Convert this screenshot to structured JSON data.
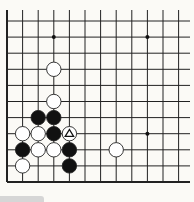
{
  "board": {
    "columns": 12,
    "rows": 11,
    "origin_x": 7,
    "origin_y": 21,
    "step_x": 15.6,
    "step_y": 16.1,
    "top_edge_y": 10,
    "right_edge_x": 190,
    "line_color": "#222222",
    "background": "#fbfaf6",
    "star_points": [
      {
        "col": 3,
        "row": 1
      },
      {
        "col": 9,
        "row": 1
      },
      {
        "col": 9,
        "row": 7
      }
    ],
    "stones": [
      {
        "color": "white",
        "col": 3,
        "row": 3
      },
      {
        "color": "white",
        "col": 3,
        "row": 5
      },
      {
        "color": "black",
        "col": 2,
        "row": 6
      },
      {
        "color": "black",
        "col": 3,
        "row": 6
      },
      {
        "color": "white",
        "col": 1,
        "row": 7
      },
      {
        "color": "white",
        "col": 2,
        "row": 7
      },
      {
        "color": "black",
        "col": 3,
        "row": 7
      },
      {
        "color": "white",
        "col": 4,
        "row": 7,
        "marker": "triangle"
      },
      {
        "color": "black",
        "col": 1,
        "row": 8
      },
      {
        "color": "white",
        "col": 2,
        "row": 8
      },
      {
        "color": "white",
        "col": 3,
        "row": 8
      },
      {
        "color": "black",
        "col": 4,
        "row": 8
      },
      {
        "color": "white",
        "col": 7,
        "row": 8
      },
      {
        "color": "white",
        "col": 1,
        "row": 9
      },
      {
        "color": "black",
        "col": 4,
        "row": 9
      }
    ],
    "last_move_marker": "triangle-icon"
  },
  "caption_bar": {
    "color": "#d6d6d6"
  }
}
